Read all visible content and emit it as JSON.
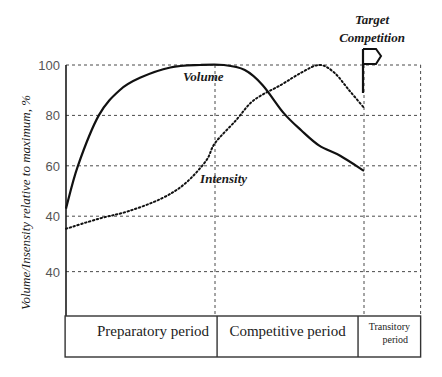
{
  "chart_data": {
    "type": "line",
    "title": "",
    "ylabel": "Volume/Insensity relative to maximum, %",
    "xlabel": "",
    "ylim": [
      0,
      100
    ],
    "xlim": [
      0,
      100
    ],
    "grid": true,
    "y_ticks": [
      {
        "value": 100,
        "label": "100"
      },
      {
        "value": 80,
        "label": "80"
      },
      {
        "value": 60,
        "label": "60"
      },
      {
        "value": 40,
        "label": "40"
      },
      {
        "value": 18,
        "label": "40"
      }
    ],
    "series": [
      {
        "name": "Volume",
        "style": "solid",
        "color": "#111111",
        "x": [
          0,
          4,
          11,
          18,
          25,
          35,
          45,
          53,
          60,
          66,
          73,
          79,
          85,
          92,
          100
        ],
        "values": [
          43,
          60,
          80,
          90,
          95,
          99,
          100,
          100,
          98,
          92,
          81,
          74,
          68,
          64,
          58
        ]
      },
      {
        "name": "Intensity",
        "style": "dotted",
        "color": "#111111",
        "x": [
          0,
          11,
          21,
          32,
          40,
          47,
          50,
          57,
          63,
          72,
          79,
          85,
          90,
          95,
          100
        ],
        "values": [
          35,
          39,
          42,
          47,
          53,
          62,
          69,
          78,
          86,
          92,
          97,
          100,
          97,
          90,
          83
        ]
      }
    ],
    "annotations": [
      {
        "text": "Volume",
        "x": 44,
        "y": 94
      },
      {
        "text": "Intensity",
        "x": 45,
        "y": 54
      },
      {
        "text_lines": [
          "Target",
          "Competition"
        ],
        "marker": "flag",
        "x": 100
      }
    ],
    "periods": [
      {
        "label": "Preparatory period",
        "x_start": -0.3,
        "x_end": 50.7
      },
      {
        "label": "Competitive period",
        "x_start": 50.7,
        "x_end": 98
      },
      {
        "label_lines": [
          "Transitory",
          "period"
        ],
        "x_start": 98,
        "x_end": 119
      }
    ],
    "vertical_gridlines_x": [
      50,
      100,
      119
    ]
  }
}
